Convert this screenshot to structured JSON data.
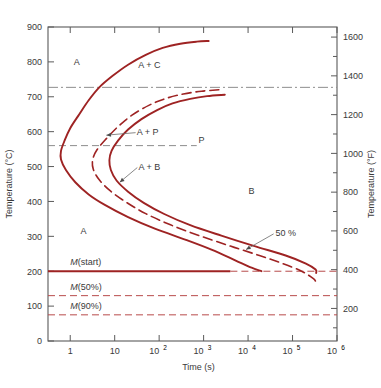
{
  "figure": {
    "title_left_axis": "Temperature (°C)",
    "title_right_axis": "Temperature (°F)",
    "title_x_axis": "Time (s)",
    "curve_color": "#9e2323",
    "axis_color": "#5a5a5a",
    "background": "#ffffff"
  },
  "axes": {
    "left_ticks": [
      "0",
      "100",
      "200",
      "300",
      "400",
      "500",
      "600",
      "700",
      "800",
      "900"
    ],
    "right_ticks": [
      "200",
      "400",
      "600",
      "800",
      "1000",
      "1200",
      "1400",
      "1600"
    ],
    "x_ticks": [
      {
        "base": "1",
        "exp": ""
      },
      {
        "base": "10",
        "exp": ""
      },
      {
        "base": "10",
        "exp": "2"
      },
      {
        "base": "10",
        "exp": "3"
      },
      {
        "base": "10",
        "exp": "4"
      },
      {
        "base": "10",
        "exp": "5"
      },
      {
        "base": "10",
        "exp": "6"
      }
    ],
    "x_range_log": [
      -0.5,
      6
    ],
    "y_range_c": [
      0,
      900
    ],
    "y_range_f": [
      32,
      1652
    ]
  },
  "labels": {
    "austenite": "A",
    "austenite_lower": "A",
    "a_plus_c": "A + C",
    "a_plus_p": "A + P",
    "a_plus_b": "A + B",
    "pearlite": "P",
    "bainite": "B",
    "fifty_percent": "50 %",
    "m_start_italic": "M",
    "m_start_rest": "(start)",
    "m_50_italic": "M",
    "m_50_rest": "(50%)",
    "m_90_italic": "M",
    "m_90_rest": "(90%)"
  },
  "chart_data": {
    "type": "line",
    "xlabel": "Time (s)",
    "ylabel": "Temperature (°C)",
    "ylabel_secondary": "Temperature (°F)",
    "xscale": "log",
    "xlim": [
      0.316,
      1000000
    ],
    "ylim": [
      0,
      900
    ],
    "ylim_secondary": [
      32,
      1652
    ],
    "grid": false,
    "legend": "none",
    "horizontal_lines": [
      {
        "name": "eutectoid-line",
        "temperature_c": 727,
        "style": "dash-dot",
        "color": "#8d8d8d",
        "x_from": 0.316,
        "x_to": 1000000
      },
      {
        "name": "pearlite-bainite-divider",
        "temperature_c": 560,
        "style": "dashed",
        "color": "#8d8d8d",
        "x_from": 0.316,
        "x_to": 700,
        "label": "P"
      },
      {
        "name": "m-start",
        "temperature_c": 200,
        "style": "solid-then-dashed",
        "color": "#9e2323",
        "x_from": 0.316,
        "x_to": 1000000,
        "solid_to": 4000,
        "label": "M(start)"
      },
      {
        "name": "m-50",
        "temperature_c": 130,
        "style": "dashed",
        "color": "#b84b4b",
        "x_from": 0.316,
        "x_to": 1000000,
        "label": "M(50%)"
      },
      {
        "name": "m-90",
        "temperature_c": 75,
        "style": "dashed",
        "color": "#b84b4b",
        "x_from": 0.316,
        "x_to": 1000000,
        "label": "M(90%)"
      }
    ],
    "series": [
      {
        "name": "transformation-start",
        "style": "solid",
        "color": "#9e2323",
        "points_time_temp": [
          [
            1300,
            860
          ],
          [
            700,
            858
          ],
          [
            300,
            852
          ],
          [
            120,
            840
          ],
          [
            50,
            820
          ],
          [
            20,
            792
          ],
          [
            9,
            760
          ],
          [
            4.5,
            727
          ],
          [
            2.6,
            690
          ],
          [
            1.6,
            650
          ],
          [
            1.0,
            610
          ],
          [
            0.75,
            575
          ],
          [
            0.62,
            545
          ],
          [
            0.62,
            520
          ],
          [
            0.8,
            490
          ],
          [
            1.3,
            455
          ],
          [
            2.6,
            420
          ],
          [
            6,
            390
          ],
          [
            20,
            355
          ],
          [
            80,
            322
          ],
          [
            400,
            290
          ],
          [
            1500,
            262
          ],
          [
            5000,
            232
          ],
          [
            12000,
            210
          ],
          [
            20000,
            200
          ]
        ]
      },
      {
        "name": "fifty-percent-transformation",
        "style": "dashed",
        "color": "#9e2323",
        "points_time_temp": [
          [
            2200,
            720
          ],
          [
            900,
            716
          ],
          [
            350,
            708
          ],
          [
            140,
            695
          ],
          [
            60,
            676
          ],
          [
            25,
            648
          ],
          [
            12,
            615
          ],
          [
            6.5,
            580
          ],
          [
            4.0,
            548
          ],
          [
            3.2,
            520
          ],
          [
            3.3,
            492
          ],
          [
            4.5,
            462
          ],
          [
            8,
            430
          ],
          [
            18,
            398
          ],
          [
            50,
            365
          ],
          [
            180,
            333
          ],
          [
            800,
            302
          ],
          [
            4000,
            272
          ],
          [
            18000,
            245
          ],
          [
            60000,
            222
          ],
          [
            160000,
            200
          ],
          [
            300000,
            178
          ],
          [
            330000,
            168
          ]
        ]
      },
      {
        "name": "transformation-finish",
        "style": "solid",
        "color": "#9e2323",
        "points_time_temp": [
          [
            3000,
            706
          ],
          [
            1200,
            702
          ],
          [
            500,
            694
          ],
          [
            200,
            681
          ],
          [
            90,
            662
          ],
          [
            40,
            636
          ],
          [
            20,
            606
          ],
          [
            12,
            575
          ],
          [
            8.5,
            545
          ],
          [
            7.6,
            518
          ],
          [
            8.2,
            490
          ],
          [
            11,
            460
          ],
          [
            20,
            428
          ],
          [
            45,
            396
          ],
          [
            130,
            364
          ],
          [
            500,
            332
          ],
          [
            2500,
            302
          ],
          [
            14000,
            272
          ],
          [
            70000,
            245
          ],
          [
            200000,
            222
          ],
          [
            330000,
            205
          ],
          [
            340000,
            195
          ]
        ]
      }
    ],
    "annotations": [
      {
        "text": "A",
        "time": 1.4,
        "temp": 800,
        "note": "austenite region upper"
      },
      {
        "text": "A + C",
        "time": 60,
        "temp": 790,
        "note": "austenite plus cementite"
      },
      {
        "text": "A + P",
        "time": 55,
        "temp": 600,
        "arrow_to_time": 6.5,
        "arrow_to_temp": 590
      },
      {
        "text": "A + B",
        "time": 60,
        "temp": 500,
        "arrow_to_time": 13,
        "arrow_to_temp": 455
      },
      {
        "text": "P",
        "time": 900,
        "temp": 575
      },
      {
        "text": "B",
        "time": 12000,
        "temp": 430
      },
      {
        "text": "50 %",
        "time": 70000,
        "temp": 310,
        "arrow_to_time": 9000,
        "arrow_to_temp": 262
      },
      {
        "text": "A",
        "time": 2.0,
        "temp": 315,
        "note": "austenite region lower"
      }
    ]
  }
}
